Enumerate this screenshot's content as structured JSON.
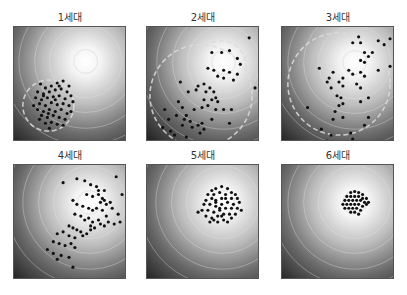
{
  "figure": {
    "panels": [
      {
        "title": "1세대",
        "left": 13,
        "top": 26,
        "title_top": 9,
        "optimum": [
          73,
          35
        ],
        "dashed_circle": {
          "cx": 35,
          "cy": 80,
          "r": 26
        },
        "points": [
          [
            27,
            58
          ],
          [
            32,
            62
          ],
          [
            38,
            60
          ],
          [
            44,
            57
          ],
          [
            50,
            55
          ],
          [
            56,
            60
          ],
          [
            24,
            66
          ],
          [
            30,
            68
          ],
          [
            36,
            66
          ],
          [
            42,
            64
          ],
          [
            48,
            63
          ],
          [
            54,
            66
          ],
          [
            58,
            70
          ],
          [
            22,
            72
          ],
          [
            28,
            74
          ],
          [
            34,
            72
          ],
          [
            40,
            71
          ],
          [
            46,
            70
          ],
          [
            52,
            73
          ],
          [
            26,
            78
          ],
          [
            32,
            80
          ],
          [
            38,
            77
          ],
          [
            44,
            79
          ],
          [
            50,
            78
          ],
          [
            56,
            80
          ],
          [
            60,
            76
          ],
          [
            24,
            84
          ],
          [
            30,
            86
          ],
          [
            36,
            84
          ],
          [
            42,
            86
          ],
          [
            48,
            84
          ],
          [
            54,
            88
          ],
          [
            28,
            90
          ],
          [
            34,
            92
          ],
          [
            40,
            90
          ],
          [
            46,
            92
          ],
          [
            52,
            94
          ],
          [
            32,
            98
          ],
          [
            38,
            97
          ],
          [
            44,
            99
          ],
          [
            26,
            94
          ],
          [
            58,
            86
          ],
          [
            20,
            80
          ],
          [
            36,
            103
          ],
          [
            50,
            100
          ],
          [
            42,
            74
          ],
          [
            30,
            70
          ],
          [
            46,
            60
          ],
          [
            35,
            88
          ]
        ]
      },
      {
        "title": "2세대",
        "left": 146,
        "top": 26,
        "title_top": 9,
        "optimum": [
          78,
          36
        ],
        "dashed_circle": {
          "cx": 55,
          "cy": 70,
          "r": 52
        },
        "dashed_arc2": {
          "cx": 75,
          "cy": 40,
          "r": 26
        },
        "points": [
          [
            104,
            11
          ],
          [
            66,
            26
          ],
          [
            76,
            26
          ],
          [
            84,
            24
          ],
          [
            95,
            38
          ],
          [
            92,
            32
          ],
          [
            62,
            42
          ],
          [
            68,
            44
          ],
          [
            78,
            44
          ],
          [
            84,
            46
          ],
          [
            72,
            50
          ],
          [
            78,
            52
          ],
          [
            88,
            54
          ],
          [
            92,
            48
          ],
          [
            110,
            62
          ],
          [
            34,
            56
          ],
          [
            52,
            60
          ],
          [
            58,
            58
          ],
          [
            64,
            62
          ],
          [
            42,
            66
          ],
          [
            50,
            64
          ],
          [
            60,
            66
          ],
          [
            68,
            66
          ],
          [
            70,
            72
          ],
          [
            58,
            74
          ],
          [
            66,
            74
          ],
          [
            72,
            76
          ],
          [
            62,
            80
          ],
          [
            56,
            82
          ],
          [
            48,
            84
          ],
          [
            70,
            84
          ],
          [
            78,
            84
          ],
          [
            86,
            84
          ],
          [
            32,
            76
          ],
          [
            36,
            82
          ],
          [
            40,
            90
          ],
          [
            18,
            84
          ],
          [
            22,
            94
          ],
          [
            30,
            90
          ],
          [
            38,
            94
          ],
          [
            44,
            96
          ],
          [
            16,
            102
          ],
          [
            24,
            106
          ],
          [
            36,
            100
          ],
          [
            46,
            102
          ],
          [
            52,
            100
          ],
          [
            56,
            98
          ],
          [
            66,
            94
          ],
          [
            84,
            98
          ],
          [
            28,
            110
          ],
          [
            40,
            112
          ],
          [
            58,
            104
          ],
          [
            54,
            108
          ],
          [
            36,
            118
          ]
        ]
      },
      {
        "title": "3세대",
        "left": 281,
        "top": 26,
        "title_top": 9,
        "optimum": [
          74,
          36
        ],
        "dashed_circle": {
          "cx": 58,
          "cy": 58,
          "r": 52
        },
        "points": [
          [
            78,
            10
          ],
          [
            72,
            16
          ],
          [
            80,
            16
          ],
          [
            98,
            14
          ],
          [
            104,
            18
          ],
          [
            110,
            12
          ],
          [
            84,
            26
          ],
          [
            88,
            30
          ],
          [
            92,
            26
          ],
          [
            80,
            34
          ],
          [
            84,
            36
          ],
          [
            110,
            40
          ],
          [
            98,
            44
          ],
          [
            68,
            44
          ],
          [
            72,
            48
          ],
          [
            80,
            46
          ],
          [
            84,
            50
          ],
          [
            38,
            42
          ],
          [
            52,
            46
          ],
          [
            48,
            52
          ],
          [
            62,
            52
          ],
          [
            46,
            56
          ],
          [
            58,
            56
          ],
          [
            62,
            60
          ],
          [
            50,
            62
          ],
          [
            76,
            58
          ],
          [
            80,
            62
          ],
          [
            56,
            70
          ],
          [
            60,
            72
          ],
          [
            80,
            76
          ],
          [
            88,
            72
          ],
          [
            58,
            80
          ],
          [
            62,
            78
          ],
          [
            54,
            86
          ],
          [
            52,
            94
          ],
          [
            62,
            92
          ],
          [
            88,
            92
          ],
          [
            84,
            100
          ],
          [
            26,
            82
          ],
          [
            70,
            108
          ],
          [
            72,
            114
          ],
          [
            50,
            110
          ],
          [
            46,
            116
          ],
          [
            48,
            118
          ],
          [
            40,
            104
          ]
        ]
      },
      {
        "title": "4세대",
        "left": 13,
        "top": 164,
        "title_top": 147,
        "optimum": [
          77,
          38
        ],
        "points": [
          [
            50,
            18
          ],
          [
            64,
            14
          ],
          [
            72,
            16
          ],
          [
            78,
            20
          ],
          [
            84,
            22
          ],
          [
            86,
            26
          ],
          [
            92,
            26
          ],
          [
            104,
            12
          ],
          [
            110,
            30
          ],
          [
            98,
            38
          ],
          [
            100,
            44
          ],
          [
            106,
            50
          ],
          [
            74,
            30
          ],
          [
            80,
            32
          ],
          [
            88,
            38
          ],
          [
            92,
            36
          ],
          [
            94,
            40
          ],
          [
            60,
            36
          ],
          [
            64,
            40
          ],
          [
            70,
            42
          ],
          [
            76,
            44
          ],
          [
            80,
            46
          ],
          [
            84,
            44
          ],
          [
            90,
            46
          ],
          [
            94,
            52
          ],
          [
            62,
            50
          ],
          [
            68,
            52
          ],
          [
            72,
            56
          ],
          [
            76,
            54
          ],
          [
            80,
            58
          ],
          [
            86,
            56
          ],
          [
            88,
            60
          ],
          [
            92,
            62
          ],
          [
            96,
            58
          ],
          [
            102,
            60
          ],
          [
            108,
            58
          ],
          [
            56,
            62
          ],
          [
            60,
            64
          ],
          [
            64,
            66
          ],
          [
            68,
            68
          ],
          [
            74,
            70
          ],
          [
            78,
            66
          ],
          [
            82,
            64
          ],
          [
            44,
            70
          ],
          [
            50,
            68
          ],
          [
            56,
            72
          ],
          [
            62,
            74
          ],
          [
            40,
            78
          ],
          [
            46,
            80
          ],
          [
            52,
            82
          ],
          [
            58,
            80
          ],
          [
            62,
            84
          ],
          [
            70,
            72
          ],
          [
            34,
            86
          ],
          [
            40,
            90
          ],
          [
            48,
            92
          ],
          [
            56,
            94
          ],
          [
            44,
            96
          ],
          [
            60,
            104
          ],
          [
            86,
            30
          ],
          [
            90,
            34
          ],
          [
            78,
            62
          ]
        ]
      },
      {
        "title": "5세대",
        "left": 146,
        "top": 164,
        "title_top": 147,
        "optimum": [
          77,
          38
        ],
        "points": [
          [
            66,
            26
          ],
          [
            70,
            24
          ],
          [
            76,
            22
          ],
          [
            82,
            24
          ],
          [
            86,
            28
          ],
          [
            90,
            30
          ],
          [
            62,
            30
          ],
          [
            68,
            30
          ],
          [
            74,
            28
          ],
          [
            80,
            30
          ],
          [
            86,
            34
          ],
          [
            92,
            34
          ],
          [
            60,
            36
          ],
          [
            66,
            34
          ],
          [
            70,
            36
          ],
          [
            76,
            34
          ],
          [
            82,
            38
          ],
          [
            88,
            40
          ],
          [
            94,
            38
          ],
          [
            58,
            40
          ],
          [
            64,
            40
          ],
          [
            70,
            42
          ],
          [
            76,
            40
          ],
          [
            80,
            44
          ],
          [
            86,
            44
          ],
          [
            92,
            44
          ],
          [
            56,
            46
          ],
          [
            62,
            46
          ],
          [
            68,
            48
          ],
          [
            74,
            46
          ],
          [
            78,
            50
          ],
          [
            84,
            50
          ],
          [
            90,
            50
          ],
          [
            60,
            52
          ],
          [
            66,
            54
          ],
          [
            72,
            52
          ],
          [
            78,
            56
          ],
          [
            86,
            54
          ],
          [
            64,
            58
          ],
          [
            72,
            58
          ],
          [
            82,
            58
          ],
          [
            52,
            48
          ],
          [
            96,
            46
          ],
          [
            70,
            38
          ],
          [
            74,
            44
          ],
          [
            68,
            56
          ],
          [
            80,
            34
          ],
          [
            76,
            52
          ]
        ]
      },
      {
        "title": "6세대",
        "left": 281,
        "top": 164,
        "title_top": 147,
        "optimum": [
          74,
          38
        ],
        "points": [
          [
            70,
            28
          ],
          [
            74,
            27
          ],
          [
            78,
            28
          ],
          [
            82,
            30
          ],
          [
            66,
            32
          ],
          [
            70,
            32
          ],
          [
            74,
            32
          ],
          [
            78,
            32
          ],
          [
            82,
            34
          ],
          [
            86,
            34
          ],
          [
            64,
            36
          ],
          [
            68,
            36
          ],
          [
            72,
            36
          ],
          [
            76,
            36
          ],
          [
            80,
            36
          ],
          [
            84,
            38
          ],
          [
            66,
            40
          ],
          [
            70,
            40
          ],
          [
            74,
            40
          ],
          [
            78,
            40
          ],
          [
            82,
            42
          ],
          [
            86,
            40
          ],
          [
            68,
            44
          ],
          [
            72,
            44
          ],
          [
            76,
            44
          ],
          [
            80,
            46
          ],
          [
            64,
            44
          ],
          [
            74,
            48
          ],
          [
            70,
            48
          ],
          [
            78,
            50
          ],
          [
            62,
            40
          ],
          [
            88,
            38
          ]
        ]
      }
    ],
    "colors": {
      "background_dark": "#0c0c0c",
      "background_mid": "#6a6a6a",
      "optimum_light": "#ffffff",
      "contour": "#e6e6e6",
      "dashed": "#dcdcdc",
      "point": "#111111"
    }
  }
}
